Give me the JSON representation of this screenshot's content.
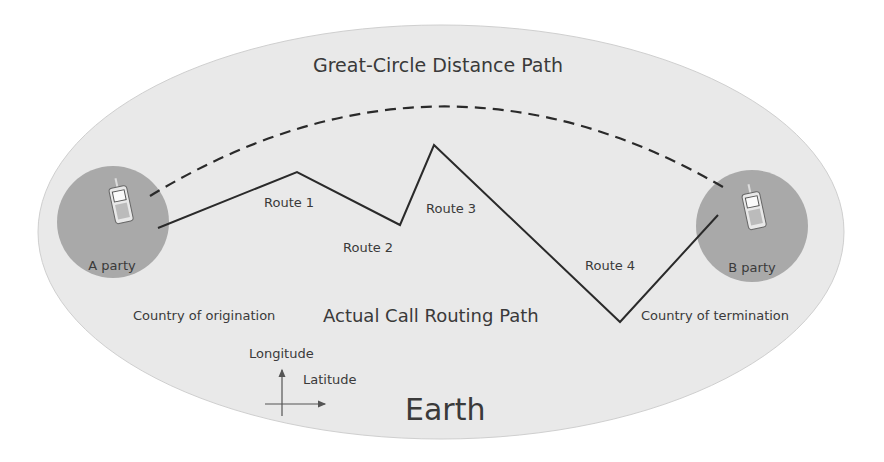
{
  "title": "Great-Circle Distance Path",
  "routing_label": "Actual Call Routing Path",
  "earth_label": "Earth",
  "parties": [
    {
      "label": "A party",
      "country": "Country of origination"
    },
    {
      "label": "B party",
      "country": "Country of termination"
    }
  ],
  "routes": [
    "Route 1",
    "Route 2",
    "Route 3",
    "Route 4"
  ],
  "axes": {
    "vertical": "Longitude",
    "horizontal": "Latitude"
  },
  "colors": {
    "earth": "#e9e9e9",
    "party_circle": "#a9a9a9",
    "line": "#2a2a2a"
  }
}
